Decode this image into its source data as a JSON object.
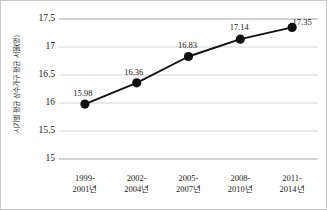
{
  "chart_data": {
    "type": "line",
    "title": "",
    "subtitle": "",
    "xlabel": "",
    "ylabel": "시기별 평균 상수가구 평균 서울(명)",
    "categories": [
      "1999-2001년",
      "2002-2004년",
      "2005-2007년",
      "2008-2010년",
      "2011-2014년"
    ],
    "category_lines": [
      {
        "line1": "1999-",
        "line2": "2001년"
      },
      {
        "line1": "2002-",
        "line2": "2004년"
      },
      {
        "line1": "2005-",
        "line2": "2007년"
      },
      {
        "line1": "2008-",
        "line2": "2010년"
      },
      {
        "line1": "2011-",
        "line2": "2014년"
      }
    ],
    "values": [
      15.98,
      16.36,
      16.83,
      17.14,
      17.35
    ],
    "point_labels": [
      "15.98",
      "16.36",
      "16.83",
      "17.14",
      "17.35"
    ],
    "ylim": [
      15,
      17.5
    ],
    "yticks": [
      17.5,
      17,
      16.5,
      16,
      15.5,
      15
    ],
    "ytick_labels": [
      "17.5",
      "17",
      "16.5",
      "16",
      "15.5",
      "15"
    ],
    "grid": true,
    "legend": "none",
    "series_color": "#111111",
    "grid_color": "#d4d4d4",
    "axis_color": "#a8a8a8",
    "marker": "circle",
    "marker_size": 4.6,
    "line_width": 1.9
  }
}
